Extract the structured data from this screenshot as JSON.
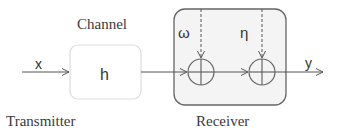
{
  "labels": {
    "channel": "Channel",
    "transmitter": "Transmitter",
    "receiver": "Receiver",
    "channel_symbol": "h",
    "input_symbol": "x",
    "output_symbol": "y",
    "noise1_symbol": "ω",
    "noise2_symbol": "η"
  },
  "colors": {
    "line": "#555555",
    "box_stroke": "#dddddd",
    "receiver_stroke": "#666666",
    "receiver_fill": "#f4f4f4",
    "text": "#333333"
  }
}
